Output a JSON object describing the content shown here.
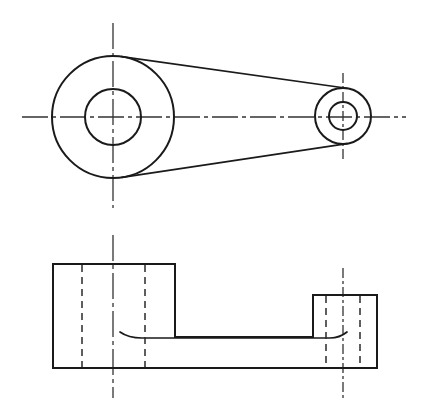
{
  "document": {
    "type": "engineering-drawing",
    "title": "Two-View Orthographic Drawing of a Bearing Link / Crank Arm",
    "projection": "third-angle-style two-view layout",
    "sheet": {
      "width": 427,
      "height": 415,
      "background": "#ffffff"
    },
    "line_styles": {
      "visible": {
        "name": "visible-edge",
        "color": "#1a1a1a",
        "width": 2
      },
      "hidden": {
        "name": "hidden-edge",
        "color": "#2a2a2a",
        "width": 1.5,
        "dash": "7 5"
      },
      "center": {
        "name": "center-line",
        "color": "#333333",
        "width": 1.3,
        "dash": "26 4 4 4"
      }
    }
  },
  "views": [
    {
      "id": "top-view",
      "name": "Top View (Plan)",
      "features": {
        "large_boss": {
          "name": "large-boss",
          "center_x": 113,
          "center_y": 117,
          "outer_radius": 61,
          "inner_radius": 28
        },
        "small_boss": {
          "name": "small-boss",
          "center_x": 343,
          "center_y": 116,
          "outer_radius": 28,
          "inner_radius": 14
        },
        "connecting_web": {
          "name": "tapered-web",
          "upper_tangent": "M 113 56 L 344 88",
          "lower_tangent": "M 113 178 L 344 144"
        },
        "horizontal_centerline": {
          "x1": 22,
          "y1": 117,
          "x2": 406,
          "y2": 117
        },
        "large_boss_vertical_centerline": {
          "x1": 113,
          "y1": 23,
          "x2": 113,
          "y2": 208
        },
        "small_boss_vertical_centerline": {
          "x1": 343,
          "y1": 73,
          "x2": 343,
          "y2": 160
        },
        "small_boss_horizontal_centerline": {
          "x1": 310,
          "y1": 116,
          "x2": 376,
          "y2": 116
        }
      }
    },
    {
      "id": "front-view",
      "name": "Front View (Elevation)",
      "features": {
        "left_block": {
          "name": "large-boss-block",
          "left": 53,
          "top": 264,
          "right": 175,
          "bottom": 368
        },
        "right_block": {
          "name": "small-boss-block",
          "left": 313,
          "top": 295,
          "right": 377,
          "bottom": 368
        },
        "base_web": {
          "name": "web-plate",
          "top": 337,
          "bottom": 368,
          "left": 53,
          "right": 377
        },
        "web_top_line": {
          "x1": 120,
          "y1": 337,
          "x2": 345,
          "y2": 337
        },
        "hidden_lines": [
          {
            "name": "left-bore-wall-near",
            "x": 82,
            "y1": 264,
            "y2": 368
          },
          {
            "name": "left-bore-wall-far",
            "x": 145,
            "y1": 264,
            "y2": 368
          },
          {
            "name": "right-bore-wall-near",
            "x": 326,
            "y1": 295,
            "y2": 368
          },
          {
            "name": "right-bore-wall-far",
            "x": 360,
            "y1": 295,
            "y2": 368
          }
        ],
        "left_centerline": {
          "x1": 113,
          "y1": 235,
          "x2": 113,
          "y2": 398
        },
        "right_centerline": {
          "x1": 343,
          "y1": 268,
          "x2": 343,
          "y2": 398
        }
      }
    }
  ]
}
